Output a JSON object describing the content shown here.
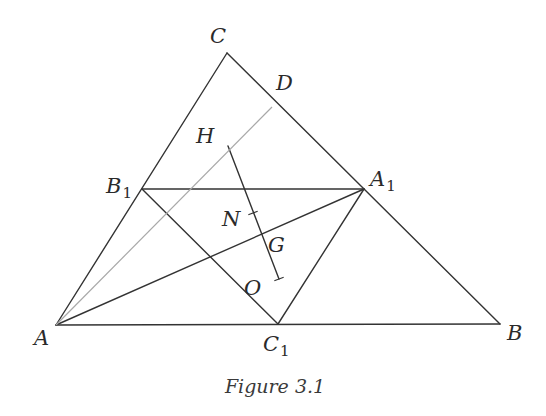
{
  "figure": {
    "caption": "Figure 3.1",
    "colors": {
      "line": "#333333",
      "light_line": "#a8a8a8",
      "text": "#2a2a2a",
      "background": "#ffffff"
    },
    "points": {
      "A": {
        "label": "A",
        "sub": "",
        "x": 56,
        "y": 325,
        "lx": 34,
        "ly": 345
      },
      "B": {
        "label": "B",
        "sub": "",
        "x": 500,
        "y": 324,
        "lx": 507,
        "ly": 340
      },
      "C": {
        "label": "C",
        "sub": "",
        "x": 227,
        "y": 53,
        "lx": 210,
        "ly": 43
      },
      "D": {
        "label": "D",
        "sub": "",
        "x": 272,
        "y": 107,
        "lx": 276,
        "ly": 90
      },
      "H": {
        "label": "H",
        "sub": "",
        "x": 228,
        "y": 146,
        "lx": 196,
        "ly": 143
      },
      "N": {
        "label": "N",
        "sub": "",
        "x": 253,
        "y": 213,
        "lx": 222,
        "ly": 226
      },
      "G": {
        "label": "G",
        "sub": "",
        "x": 261,
        "y": 234,
        "lx": 268,
        "ly": 252
      },
      "O": {
        "label": "O",
        "sub": "",
        "x": 279,
        "y": 279,
        "lx": 244,
        "ly": 295
      },
      "A1": {
        "label": "A",
        "sub": "1",
        "x": 364,
        "y": 189,
        "lx": 370,
        "ly": 186
      },
      "B1": {
        "label": "B",
        "sub": "1",
        "x": 142,
        "y": 189,
        "lx": 106,
        "ly": 193
      },
      "C1": {
        "label": "C",
        "sub": "1",
        "x": 278,
        "y": 324,
        "lx": 263,
        "ly": 351
      }
    },
    "segments": [
      {
        "name": "side-ab",
        "from": "A",
        "to": "B",
        "style": "dark"
      },
      {
        "name": "side-bc",
        "from": "B",
        "to": "C",
        "style": "dark"
      },
      {
        "name": "side-ca",
        "from": "C",
        "to": "A",
        "style": "dark"
      },
      {
        "name": "midline-a1b1",
        "from": "A1",
        "to": "B1",
        "style": "dark"
      },
      {
        "name": "midline-b1c1",
        "from": "B1",
        "to": "C1",
        "style": "dark"
      },
      {
        "name": "midline-c1a1",
        "from": "C1",
        "to": "A1",
        "style": "dark"
      },
      {
        "name": "median-aa1",
        "from": "A",
        "to": "A1",
        "style": "dark"
      },
      {
        "name": "euler-line-ho",
        "from": "H",
        "to": "O",
        "style": "dark"
      },
      {
        "name": "altitude-ad",
        "from": "A",
        "to": "D",
        "style": "light"
      }
    ],
    "ticks": [
      "N",
      "O"
    ]
  }
}
